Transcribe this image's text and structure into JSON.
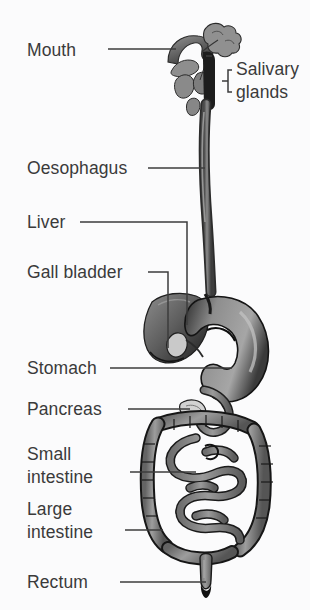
{
  "figure": {
    "type": "anatomical-diagram",
    "background_color": "#fbfbfc",
    "label_color": "#3a3a3a",
    "leader_color": "#3c3c3c"
  },
  "labels": {
    "mouth": "Mouth",
    "salivary_glands_line1": "Salivary",
    "salivary_glands_line2": "glands",
    "oesophagus": "Oesophagus",
    "liver": "Liver",
    "gall_bladder": "Gall bladder",
    "stomach": "Stomach",
    "pancreas": "Pancreas",
    "small_intestine_line1": "Small",
    "small_intestine_line2": "intestine",
    "large_intestine_line1": "Large",
    "large_intestine_line2": "intestine",
    "rectum": "Rectum"
  }
}
